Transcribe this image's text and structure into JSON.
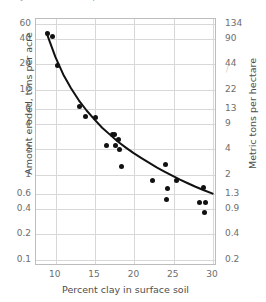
{
  "figure": {
    "title_partial": "Clay in the soil compared with the amount of soil eroded",
    "background": "#ffffff",
    "point_color": "#111111",
    "curve_color": "#111111",
    "grid_color": "#d8d8d8",
    "frame_color": "#bdbdbd"
  },
  "chart_data": {
    "type": "scatter",
    "title": "",
    "xlabel": "Percent clay in surface soil",
    "ylabel": "Amount eroded, tons per acre",
    "y2label": "Metric tons per hectare",
    "xscale": "linear",
    "yscale": "log",
    "xlim": [
      7.5,
      30.5
    ],
    "ylim": [
      0.085,
      68
    ],
    "grid": true,
    "legend": "none",
    "xticks": [
      10,
      15,
      20,
      25,
      30
    ],
    "xtick_labels": [
      "10",
      "15",
      "20",
      "25",
      "30"
    ],
    "yticks": [
      60,
      40,
      20,
      10,
      6,
      4,
      2,
      1,
      0.6,
      0.4,
      0.2,
      0.1
    ],
    "ytick_labels": [
      "60",
      "40",
      "20",
      "10",
      "6",
      "4",
      "2",
      "1",
      "0.6",
      "0.4",
      "0.2",
      "0.1"
    ],
    "y2ticks": [
      134,
      90,
      44,
      22,
      13,
      9,
      4,
      2,
      1.3,
      0.9,
      0.4,
      0.2
    ],
    "y2tick_labels": [
      "134",
      "90",
      "44",
      "22",
      "13",
      "9",
      "4",
      "2",
      "1.3",
      "0.9",
      "0.4",
      "0.2"
    ],
    "series": [
      {
        "name": "Observed erosion",
        "marker": "filled-circle",
        "points": [
          {
            "x": 8.9,
            "y": 46.0
          },
          {
            "x": 9.6,
            "y": 42.0
          },
          {
            "x": 10.2,
            "y": 19.5
          },
          {
            "x": 13.0,
            "y": 6.4
          },
          {
            "x": 13.8,
            "y": 4.9
          },
          {
            "x": 15.0,
            "y": 4.8
          },
          {
            "x": 17.2,
            "y": 3.0
          },
          {
            "x": 17.5,
            "y": 3.0
          },
          {
            "x": 18.0,
            "y": 2.6
          },
          {
            "x": 16.5,
            "y": 2.2
          },
          {
            "x": 17.6,
            "y": 2.2
          },
          {
            "x": 18.1,
            "y": 2.0
          },
          {
            "x": 18.3,
            "y": 1.25
          },
          {
            "x": 23.9,
            "y": 1.32
          },
          {
            "x": 22.3,
            "y": 0.86
          },
          {
            "x": 25.4,
            "y": 0.85
          },
          {
            "x": 24.2,
            "y": 0.7
          },
          {
            "x": 28.8,
            "y": 0.72
          },
          {
            "x": 24.1,
            "y": 0.52
          },
          {
            "x": 28.3,
            "y": 0.48
          },
          {
            "x": 29.0,
            "y": 0.47
          },
          {
            "x": 28.9,
            "y": 0.36
          }
        ]
      }
    ],
    "fit_curve": {
      "name": "Fitted trend",
      "style": "solid",
      "points": [
        {
          "x": 8.85,
          "y": 47.0
        },
        {
          "x": 9.3,
          "y": 36.0
        },
        {
          "x": 10.0,
          "y": 24.0
        },
        {
          "x": 11.0,
          "y": 15.0
        },
        {
          "x": 12.0,
          "y": 10.3
        },
        {
          "x": 13.0,
          "y": 7.4
        },
        {
          "x": 14.0,
          "y": 5.6
        },
        {
          "x": 15.0,
          "y": 4.4
        },
        {
          "x": 16.0,
          "y": 3.5
        },
        {
          "x": 17.0,
          "y": 2.9
        },
        {
          "x": 18.0,
          "y": 2.4
        },
        {
          "x": 19.0,
          "y": 2.05
        },
        {
          "x": 20.0,
          "y": 1.76
        },
        {
          "x": 21.0,
          "y": 1.54
        },
        {
          "x": 22.0,
          "y": 1.35
        },
        {
          "x": 23.0,
          "y": 1.19
        },
        {
          "x": 24.0,
          "y": 1.06
        },
        {
          "x": 25.0,
          "y": 0.95
        },
        {
          "x": 26.0,
          "y": 0.85
        },
        {
          "x": 27.0,
          "y": 0.77
        },
        {
          "x": 28.0,
          "y": 0.7
        },
        {
          "x": 29.0,
          "y": 0.64
        },
        {
          "x": 30.2,
          "y": 0.58
        }
      ]
    }
  }
}
